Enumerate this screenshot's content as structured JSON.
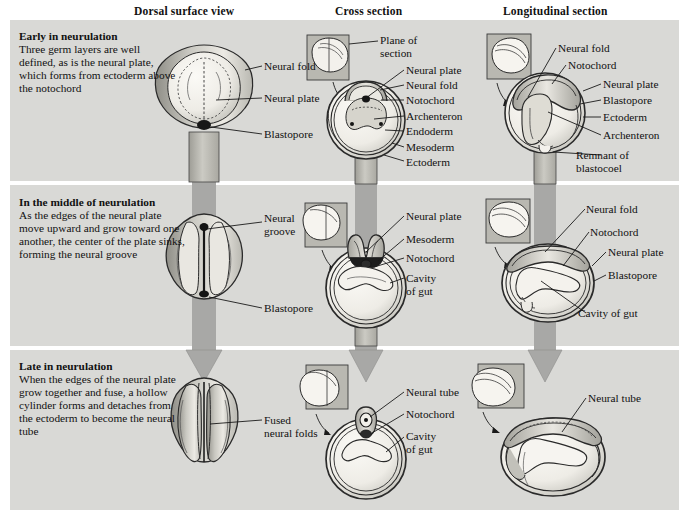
{
  "figure": {
    "columns": [
      {
        "id": "dorsal",
        "label": "Dorsal surface view"
      },
      {
        "id": "cross",
        "label": "Cross section"
      },
      {
        "id": "longitudinal",
        "label": "Longitudinal section"
      }
    ]
  },
  "stages": [
    {
      "id": "early",
      "title": "Early in neurulation",
      "body": "Three germ layers are well defined, as is the neural plate, which forms from ectoderm above the notochord"
    },
    {
      "id": "middle",
      "title": "In the middle of neurulation",
      "body": "As the edges of the neural plate move upward and grow toward one another, the center of the plate sinks, forming the neural groove"
    },
    {
      "id": "late",
      "title": "Late in neurulation",
      "body": "When the edges of the neural plate grow together and fuse, a hollow cylinder forms and detaches from the ectoderm to become the neural tube"
    }
  ],
  "labels": {
    "row1": {
      "dorsal": [
        "Neural fold",
        "Neural plate",
        "Blastopore"
      ],
      "cross": [
        "Plane of\nsection",
        "Neural plate",
        "Neural fold",
        "Notochord",
        "Archenteron",
        "Endoderm",
        "Mesoderm",
        "Ectoderm"
      ],
      "longitudinal": [
        "Neural fold",
        "Notochord",
        "Neural plate",
        "Blastopore",
        "Ectoderm",
        "Archenteron",
        "Remnant of\nblastocoel"
      ]
    },
    "row2": {
      "dorsal": [
        "Neural\ngroove",
        "Blastopore"
      ],
      "cross": [
        "Neural plate",
        "Mesoderm",
        "Notochord",
        "Cavity\nof gut"
      ],
      "longitudinal": [
        "Neural fold",
        "Notochord",
        "Neural plate",
        "Blastopore",
        "Cavity of gut"
      ]
    },
    "row3": {
      "dorsal": [
        "Fused\nneural folds"
      ],
      "cross": [
        "Neural tube",
        "Notochord",
        "Cavity\nof gut"
      ],
      "longitudinal": [
        "Neural tube"
      ]
    }
  },
  "colors": {
    "band": "#d9d9d6",
    "page": "#ffffff",
    "arrow": "#a8a8a6",
    "ink": "#1a1a1a",
    "tissue_light": "#f0efe9",
    "tissue_mid": "#cfcec7",
    "tissue_dark": "#9b9a93"
  }
}
